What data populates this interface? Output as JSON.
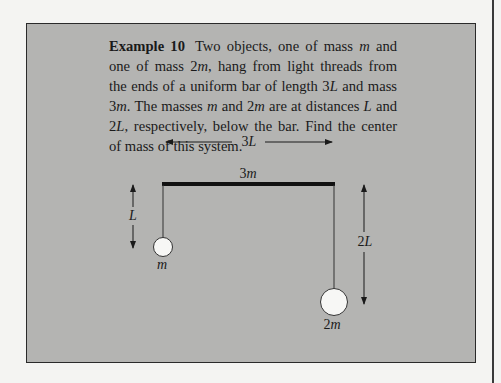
{
  "example": {
    "label": "Example 10",
    "text_parts": [
      {
        "t": " Two objects, one of mass "
      },
      {
        "i": "m"
      },
      {
        "t": " and one of mass 2"
      },
      {
        "i": "m"
      },
      {
        "t": ", hang from light threads from the ends of a uniform bar of length 3"
      },
      {
        "i": "L"
      },
      {
        "t": " and mass 3"
      },
      {
        "i": "m"
      },
      {
        "t": ". The masses "
      },
      {
        "i": "m"
      },
      {
        "t": " and 2"
      },
      {
        "i": "m"
      },
      {
        "t": " are at distances "
      },
      {
        "i": "L"
      },
      {
        "t": " and 2"
      },
      {
        "i": "L"
      },
      {
        "t": ", respectively, below the bar. Find the center of mass of this system."
      }
    ]
  },
  "diagram": {
    "bar_length_label": {
      "num": "3",
      "var": "L"
    },
    "bar_mass_label": {
      "num": "3",
      "var": "m"
    },
    "left_distance_label": {
      "num": "",
      "var": "L"
    },
    "right_distance_label": {
      "num": "2",
      "var": "L"
    },
    "left_mass_label": {
      "num": "",
      "var": "m"
    },
    "right_mass_label": {
      "num": "2",
      "var": "m"
    }
  },
  "colors": {
    "page_background": "#f4f4f2",
    "box_background": "#b4b4b2",
    "ink": "#1a1a1a",
    "mass_fill": "#f7f7f5"
  }
}
